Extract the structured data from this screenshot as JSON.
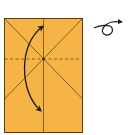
{
  "diagram": {
    "type": "origami-fold-step",
    "paper": {
      "fill": "#F5B445",
      "stroke": "#5a3d10",
      "crease_color": "#6b4712",
      "rect": {
        "x": 4,
        "y": 18,
        "width": 79,
        "height": 115
      }
    },
    "creases": [
      {
        "name": "vertical-center-crease",
        "style": "solid"
      },
      {
        "name": "diagonal-crease-left",
        "style": "solid"
      },
      {
        "name": "diagonal-crease-right",
        "style": "solid"
      },
      {
        "name": "horizontal-valley-fold-line",
        "style": "dashed"
      }
    ],
    "arrows": [
      {
        "name": "fold-arrow",
        "description": "curved double-headed arrow indicating fold up and down"
      },
      {
        "name": "turn-over-symbol",
        "description": "loop arrow indicating turn model over"
      }
    ],
    "ink_color": "#1a1a1a"
  }
}
